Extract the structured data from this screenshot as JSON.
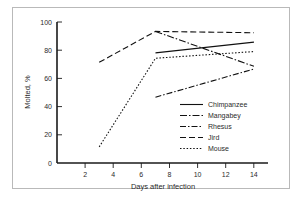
{
  "figure": {
    "border_color": "#b9b9b9",
    "background": "#ffffff"
  },
  "chart_data": {
    "type": "line",
    "title": "",
    "xlabel": "Days after infection",
    "ylabel": "Molted, %",
    "xlim": [
      0,
      15
    ],
    "ylim": [
      0,
      105
    ],
    "xticks": [
      "2",
      "4",
      "6",
      "8",
      "10",
      "12",
      "14"
    ],
    "xtick_values": [
      2,
      4,
      6,
      8,
      10,
      12,
      14
    ],
    "yticks": [
      "0",
      "20",
      "40",
      "60",
      "80",
      "100"
    ],
    "ytick_values": [
      0,
      20,
      40,
      60,
      80,
      100
    ],
    "grid": false,
    "legend_position": "center-right",
    "series": [
      {
        "name": "Chimpanzee",
        "style": "solid",
        "dash": "none",
        "color": "#111111",
        "x": [
          7,
          14
        ],
        "y": [
          82,
          90
        ]
      },
      {
        "name": "Mangabey",
        "style": "dash-dot",
        "dash": "7,2,1.5,2",
        "color": "#111111",
        "x": [
          7,
          14
        ],
        "y": [
          98,
          72
        ]
      },
      {
        "name": "Rhesus",
        "style": "dash-dot-long",
        "dash": "6,2,1.5,2",
        "color": "#111111",
        "x": [
          7,
          14
        ],
        "y": [
          49,
          70
        ]
      },
      {
        "name": "Jird",
        "style": "dashed",
        "dash": "6,3",
        "color": "#111111",
        "x": [
          3,
          7,
          14
        ],
        "y": [
          75,
          98,
          97
        ]
      },
      {
        "name": "Mouse",
        "style": "dotted",
        "dash": "1.5,1.8",
        "color": "#111111",
        "x": [
          3,
          7,
          14
        ],
        "y": [
          12,
          78,
          83
        ]
      }
    ]
  },
  "legend": {
    "items": [
      {
        "label": "Chimpanzee"
      },
      {
        "label": "Mangabey"
      },
      {
        "label": "Rhesus"
      },
      {
        "label": "Jird"
      },
      {
        "label": "Mouse"
      }
    ]
  }
}
